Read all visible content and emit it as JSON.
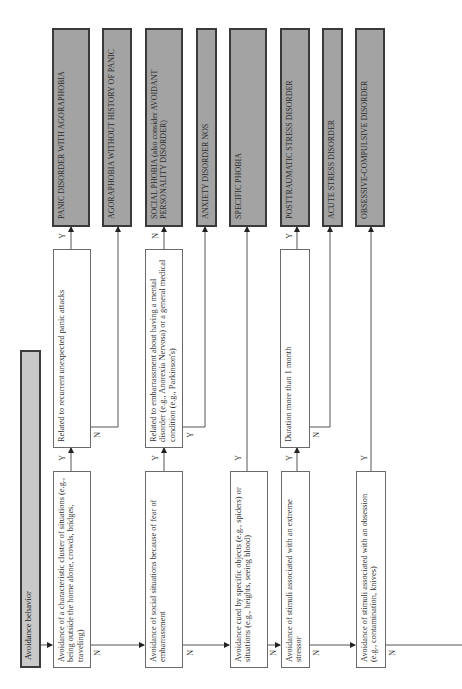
{
  "diagram": {
    "type": "decision-flowchart",
    "orientation": "rotated-90-ccw",
    "start": {
      "label": "Avoidance behavior"
    },
    "questions": [
      {
        "id": "q1",
        "label": "Avoidance of a characteristic cluster of situations (e.g., being outside the home alone, crowds, bridges, traveling)",
        "yes": "q1a",
        "no": "q2"
      },
      {
        "id": "q2",
        "label": "Avoidance of social situations because of fear of embarrassment",
        "yes": "q2a",
        "no": "q3"
      },
      {
        "id": "q3",
        "label": "Avoidance cued by specific objects (e.g., spiders) or situations (e.g., heights, seeing blood)",
        "yes": "specific_phobia",
        "no": "q4"
      },
      {
        "id": "q4",
        "label": "Avoidance of stimuli associated with an extreme stressor",
        "yes": "q4a",
        "no": "q5"
      },
      {
        "id": "q5",
        "label": "Avoidance of stimuli associated with an obsession (e.g., contamination, knives)",
        "yes": "ocd",
        "no": "continues"
      }
    ],
    "subquestions": [
      {
        "id": "q1a",
        "label": "Related to recurrent unexpected panic attacks",
        "yes": "panic_agora",
        "no": "agora_no_panic"
      },
      {
        "id": "q2a",
        "label": "Related to embarrassment about having a mental disorder (e.g., Anorexia Nervosa) or a general medical condition (e.g., Parkinson's)",
        "yes": "anxiety_nos",
        "no": "social_phobia"
      },
      {
        "id": "q4a",
        "label": "Duration more than 1 month",
        "yes": "ptsd",
        "no": "acute_stress"
      }
    ],
    "outcomes": [
      {
        "id": "panic_agora",
        "label": "PANIC DISORDER WITH AGORAPHOBIA"
      },
      {
        "id": "agora_no_panic",
        "label": "AGORAPHOBIA WITHOUT HISTORY OF PANIC"
      },
      {
        "id": "social_phobia",
        "label": "SOCIAL PHOBIA (also consider AVOIDANT PERSONALITY DISORDER)"
      },
      {
        "id": "anxiety_nos",
        "label": "ANXIETY DISORDER NOS"
      },
      {
        "id": "specific_phobia",
        "label": "SPECIFIC PHOBIA"
      },
      {
        "id": "ptsd",
        "label": "POSTTRAUMATIC STRESS DISORDER"
      },
      {
        "id": "acute_stress",
        "label": "ACUTE STRESS DISORDER"
      },
      {
        "id": "ocd",
        "label": "OBSESSIVE-COMPULSIVE DISORDER"
      }
    ],
    "edge_labels": {
      "yes": "Y",
      "no": "N"
    }
  },
  "colors": {
    "outcome_fill": "#a3a3a3",
    "start_fill": "#c9c9c9",
    "border": "#3a3a3a",
    "line": "#555555"
  }
}
